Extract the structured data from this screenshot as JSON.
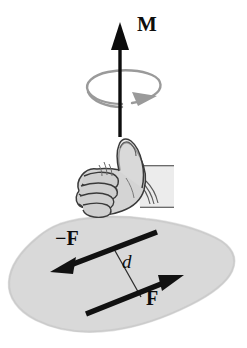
{
  "figure": {
    "background_color": "#ffffff",
    "width": 247,
    "height": 348,
    "labels": {
      "moment": "M",
      "force_negative": "−F",
      "force_positive": "F",
      "distance": "d"
    },
    "colors": {
      "ink": "#0d0d0d",
      "plane_fill": "#d8d8d8",
      "plane_edge": "#cfcfcf",
      "rotation_arrow": "#8c8c8c",
      "hand_outline": "#3a3a3a",
      "hand_fill": "#d5d5d5",
      "hand_shadow": "#bdbdbd"
    },
    "elements": [
      {
        "name": "moment-axis-arrow",
        "type": "arrow",
        "label": "M",
        "direction": "up",
        "from": [
          120,
          136
        ],
        "to": [
          120,
          26
        ]
      },
      {
        "name": "rotation-ellipse-arrow",
        "type": "curved-arrow",
        "sense": "counterclockwise-from-above",
        "center": [
          120,
          88
        ],
        "rx": 33,
        "ry": 16
      },
      {
        "name": "right-hand-thumbs-up",
        "type": "illustration",
        "description": "right hand, closed fist with thumb pointing up"
      },
      {
        "name": "plane-blob",
        "type": "shape",
        "description": "shaded irregular plane containing the couple"
      },
      {
        "name": "force-negative-arrow",
        "type": "arrow",
        "label": "−F",
        "from": [
          156,
          233
        ],
        "to": [
          52,
          272
        ]
      },
      {
        "name": "force-positive-arrow",
        "type": "arrow",
        "label": "F",
        "from": [
          86,
          314
        ],
        "to": [
          182,
          276
        ]
      },
      {
        "name": "distance-line",
        "type": "line",
        "label": "d",
        "from": [
          115,
          250
        ],
        "to": [
          141,
          296
        ]
      }
    ]
  }
}
